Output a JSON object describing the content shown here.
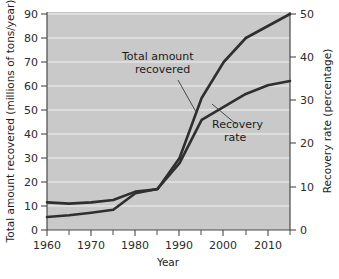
{
  "figure": {
    "background_color": "#ffffff",
    "plot_background_color": "#c9c9c9",
    "gridline_color": "#f2f2f2",
    "line_color": "#2f2f2f"
  },
  "axes": {
    "x": {
      "title": "Year",
      "ticks": [
        "1960",
        "1970",
        "1980",
        "1990",
        "2000",
        "2010"
      ],
      "tick_values": [
        1960,
        1970,
        1980,
        1990,
        2000,
        2010
      ],
      "minor_tick_values": [
        1965,
        1975,
        1985,
        1995,
        2005,
        2015
      ],
      "range": [
        1960,
        2015
      ]
    },
    "y_left": {
      "title": "Total amount recovered (millions of tons/year)",
      "ticks": [
        "0",
        "10",
        "20",
        "30",
        "40",
        "50",
        "60",
        "70",
        "80",
        "90"
      ],
      "tick_values": [
        0,
        10,
        20,
        30,
        40,
        50,
        60,
        70,
        80,
        90
      ],
      "range": [
        0,
        90
      ]
    },
    "y_right": {
      "title": "Recovery rate (percentage)",
      "ticks": [
        "0",
        "10",
        "20",
        "30",
        "40",
        "50"
      ],
      "tick_values": [
        0,
        10,
        20,
        30,
        40,
        50
      ],
      "range": [
        0,
        50
      ]
    }
  },
  "annotations": [
    {
      "id": "total-amount-recovered",
      "line1": "Total amount",
      "line2": "recovered",
      "text_x": 122,
      "text_y": 60,
      "leader": [
        [
          178,
          80
        ],
        [
          196,
          112
        ]
      ]
    },
    {
      "id": "recovery-rate",
      "line1": "Recovery",
      "line2": "rate",
      "text_x": 212,
      "text_y": 128,
      "leader": [
        [
          236,
          124
        ],
        [
          212,
          104
        ]
      ]
    }
  ],
  "chart_data": {
    "type": "line",
    "title": "",
    "xlabel": "Year",
    "ylabel": "Total amount recovered (millions of tons/year)",
    "ylabel_right": "Recovery rate (percentage)",
    "xlim": [
      1960,
      2015
    ],
    "ylim": [
      0,
      90
    ],
    "ylim_right": [
      0,
      50
    ],
    "grid": true,
    "legend": "annotated-inline",
    "x": [
      1960,
      1965,
      1970,
      1975,
      1980,
      1985,
      1990,
      1995,
      2000,
      2005,
      2010,
      2015
    ],
    "series": [
      {
        "name": "Total amount recovered",
        "axis": "left",
        "units": "millions of tons/year",
        "values": [
          11.5,
          11,
          11.5,
          12.5,
          16,
          17,
          30,
          55,
          70,
          80,
          85,
          90
        ]
      },
      {
        "name": "Recovery rate",
        "axis": "right",
        "units": "percentage",
        "values": [
          3,
          3.4,
          4,
          4.7,
          8.5,
          9.5,
          15.5,
          25.5,
          28.5,
          31.5,
          33.5,
          34.5
        ]
      }
    ],
    "series_left_equivalent": [
      {
        "name": "Recovery rate (plotted on left scale)",
        "values": [
          5.4,
          6.1,
          7.2,
          8.5,
          15.3,
          17.1,
          27.9,
          45.9,
          51.3,
          56.7,
          60.3,
          62.1
        ]
      }
    ]
  }
}
